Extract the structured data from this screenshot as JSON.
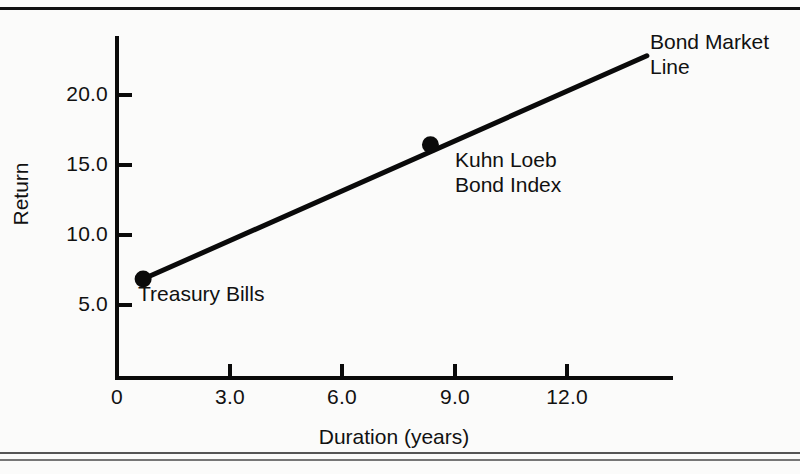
{
  "chart_data": {
    "type": "line",
    "title": "",
    "xlabel": "Duration (years)",
    "ylabel": "Return",
    "xlim": [
      0,
      14.9
    ],
    "ylim": [
      0,
      24.2
    ],
    "grid": false,
    "legend": "none",
    "xticks": [
      "0",
      "3.0",
      "6.0",
      "9.0",
      "12.0"
    ],
    "xtick_values": [
      0,
      3.0,
      6.0,
      9.0,
      12.0
    ],
    "yticks": [
      "5.0",
      "10.0",
      "15.0",
      "20.0"
    ],
    "ytick_values": [
      5.0,
      10.0,
      15.0,
      20.0
    ],
    "series": [
      {
        "name": "Bond Market Line",
        "x": [
          0.7,
          14.2
        ],
        "values": [
          7.0,
          22.8
        ]
      }
    ],
    "points": [
      {
        "label": "Treasury Bills",
        "x": 0.7,
        "y": 7.0
      },
      {
        "label": "Kuhn Loeb Bond Index",
        "x": 8.4,
        "y": 16.5
      }
    ],
    "annotations": [
      {
        "name": "treasury-bills",
        "text": "Treasury Bills",
        "x": 0.7,
        "y": 7.0
      },
      {
        "name": "kuhn-loeb-bond-index",
        "text": "Kuhn Loeb\nBond Index",
        "x": 8.4,
        "y": 16.5
      },
      {
        "name": "bond-market-line",
        "text": "Bond Market\nLine",
        "x": 14.2,
        "y": 22.8
      }
    ]
  },
  "colors": {
    "background": "#fbfbfa",
    "ink": "#0a0a0a",
    "text": "#111111"
  },
  "axis": {
    "x_title": "Duration (years)",
    "y_title": "Return",
    "x_tick_labels": [
      "0",
      "3.0",
      "6.0",
      "9.0",
      "12.0"
    ],
    "y_tick_labels": [
      "20.0",
      "15.0",
      "10.0",
      "5.0"
    ]
  },
  "annotations": {
    "treasury_bills": "Treasury Bills",
    "kuhn_loeb": "Kuhn Loeb\nBond Index",
    "bond_market": "Bond Market\nLine"
  }
}
